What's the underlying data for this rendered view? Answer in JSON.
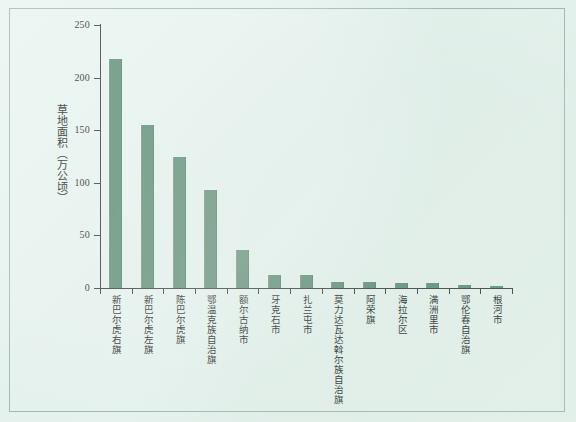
{
  "chart_data": {
    "type": "bar",
    "title": "",
    "xlabel": "",
    "ylabel": "草地面积（万公顷）",
    "ylim": [
      0,
      250
    ],
    "yticks": [
      0,
      50,
      100,
      150,
      200,
      250
    ],
    "grid": false,
    "legend": "none",
    "bar_color": "#5f8d76",
    "background_color": "#e9f4ef",
    "axis_color": "#3a3a3a",
    "categories": [
      "新巴尔虎右旗",
      "新巴尔虎左旗",
      "陈巴尔虎旗",
      "鄂温克族自治旗",
      "额尔古纳市",
      "牙克石市",
      "扎兰屯市",
      "莫力达瓦达斡尔族自治旗",
      "阿荣旗",
      "海拉尔区",
      "满洲里市",
      "鄂伦春自治旗",
      "根河市"
    ],
    "values": [
      218,
      155,
      125,
      93,
      36,
      12,
      12,
      6,
      5.5,
      5,
      5,
      3,
      2
    ]
  },
  "axis": {
    "tick_labels": [
      "0",
      "50",
      "100",
      "150",
      "200",
      "250"
    ]
  }
}
